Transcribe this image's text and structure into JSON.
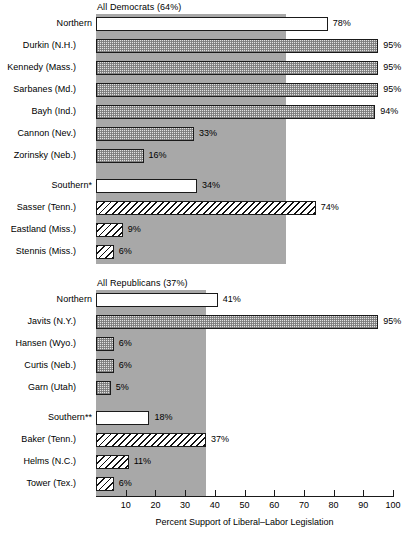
{
  "chart_data": {
    "type": "bar",
    "orientation": "horizontal",
    "title": "",
    "xlabel": "Percent Support of Liberal–Labor Legislation",
    "ylabel": "",
    "xlim": [
      0,
      100
    ],
    "xticks": [
      10,
      20,
      30,
      40,
      50,
      60,
      70,
      80,
      90,
      100
    ],
    "xtick_labels": [
      "10",
      "20",
      "30",
      "40",
      "50",
      "60",
      "70",
      "80",
      "90",
      "100"
    ],
    "grid": false,
    "legend": null,
    "value_suffix": "%",
    "groups": [
      {
        "header": "All Democrats (64%)",
        "reference_value": 64,
        "reference_label": "64%",
        "subgroups": [
          {
            "name": "Northern",
            "summary": {
              "label": "Northern",
              "value": 78,
              "value_label": "78%",
              "style": "fill-white"
            },
            "rows": [
              {
                "label": "Durkin (N.H.)",
                "value": 95,
                "value_label": "95%",
                "style": "fill-dots"
              },
              {
                "label": "Kennedy (Mass.)",
                "value": 95,
                "value_label": "95%",
                "style": "fill-dots"
              },
              {
                "label": "Sarbanes (Md.)",
                "value": 95,
                "value_label": "95%",
                "style": "fill-dots"
              },
              {
                "label": "Bayh (Ind.)",
                "value": 94,
                "value_label": "94%",
                "style": "fill-dots"
              },
              {
                "label": "Cannon (Nev.)",
                "value": 33,
                "value_label": "33%",
                "style": "fill-dots"
              },
              {
                "label": "Zorinsky (Neb.)",
                "value": 16,
                "value_label": "16%",
                "style": "fill-dots"
              }
            ]
          },
          {
            "name": "Southern*",
            "summary": {
              "label": "Southern*",
              "value": 34,
              "value_label": "34%",
              "style": "fill-white"
            },
            "rows": [
              {
                "label": "Sasser (Tenn.)",
                "value": 74,
                "value_label": "74%",
                "style": "fill-hatch"
              },
              {
                "label": "Eastland (Miss.)",
                "value": 9,
                "value_label": "9%",
                "style": "fill-hatch"
              },
              {
                "label": "Stennis (Miss.)",
                "value": 6,
                "value_label": "6%",
                "style": "fill-hatch"
              }
            ]
          }
        ]
      },
      {
        "header": "All Republicans (37%)",
        "reference_value": 37,
        "reference_label": "37%",
        "subgroups": [
          {
            "name": "Northern",
            "summary": {
              "label": "Northern",
              "value": 41,
              "value_label": "41%",
              "style": "fill-white"
            },
            "rows": [
              {
                "label": "Javits (N.Y.)",
                "value": 95,
                "value_label": "95%",
                "style": "fill-dots"
              },
              {
                "label": "Hansen (Wyo.)",
                "value": 6,
                "value_label": "6%",
                "style": "fill-dots"
              },
              {
                "label": "Curtis (Neb.)",
                "value": 6,
                "value_label": "6%",
                "style": "fill-dots"
              },
              {
                "label": "Garn (Utah)",
                "value": 5,
                "value_label": "5%",
                "style": "fill-dots"
              }
            ]
          },
          {
            "name": "Southern**",
            "summary": {
              "label": "Southern**",
              "value": 18,
              "value_label": "18%",
              "style": "fill-white"
            },
            "rows": [
              {
                "label": "Baker (Tenn.)",
                "value": 37,
                "value_label": "37%",
                "style": "fill-hatch"
              },
              {
                "label": "Helms (N.C.)",
                "value": 11,
                "value_label": "11%",
                "style": "fill-hatch"
              },
              {
                "label": "Tower (Tex.)",
                "value": 6,
                "value_label": "6%",
                "style": "fill-hatch"
              }
            ]
          }
        ]
      }
    ],
    "colors": {
      "band": "#a8a8a8",
      "bar_outline": "#1a1a1a",
      "bar_white": "#ffffff",
      "bar_dots": "#e2e2e2",
      "text": "#000000"
    }
  }
}
